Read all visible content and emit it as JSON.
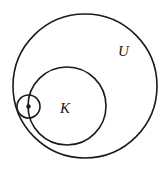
{
  "figure": {
    "kind": "euler-set-diagram",
    "width": 167,
    "height": 173,
    "background_color": "#ffffff",
    "stroke_color": "#1a1a1a",
    "labels": {
      "universe": "U",
      "subset": "K"
    },
    "shapes": {
      "universe_circle": {
        "name": "U",
        "cx": 85,
        "cy": 86,
        "r": 72,
        "stroke_width": 1.6,
        "fill": "none"
      },
      "subset_circle": {
        "name": "K",
        "cx": 67,
        "cy": 106,
        "r": 39,
        "stroke_width": 1.6,
        "fill": "none"
      },
      "point_circle": {
        "name": "neighborhood",
        "cx": 28.5,
        "cy": 106.5,
        "r": 11.5,
        "stroke_width": 1.6,
        "fill": "none"
      },
      "center_point": {
        "name": "point",
        "cx": 28.5,
        "cy": 106.5,
        "r": 2.2,
        "fill": "#1a1a1a"
      }
    },
    "label_positions": {
      "universe": {
        "x": 118,
        "y": 56,
        "font_size": 15
      },
      "subset": {
        "x": 60,
        "y": 113,
        "font_size": 15
      }
    }
  }
}
